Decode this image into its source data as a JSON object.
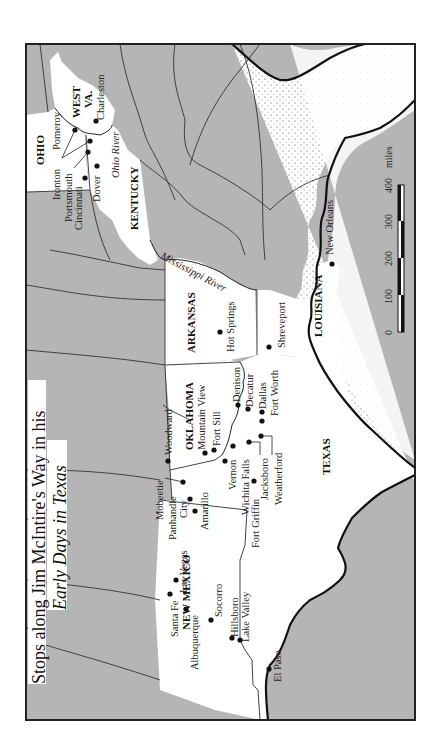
{
  "title": {
    "line1": "Stops along Jim McIntire's Way in his",
    "line2": "Early Days in Texas"
  },
  "states": {
    "ohio": "OHIO",
    "west_va_1": "WEST",
    "west_va_2": "VA.",
    "kentucky": "KENTUCKY",
    "arkansas": "ARKANSAS",
    "louisiana": "LOUISIANA",
    "oklahoma": "OKLAHOMA",
    "texas": "TEXAS",
    "new_mexico": "NEW MEXICO"
  },
  "rivers": {
    "ohio": "Ohio River",
    "mississippi": "Mississippi River"
  },
  "places": {
    "ironton": "Ironton",
    "pomeroy": "Pomeroy",
    "charleston": "Charleston",
    "portsmouth": "Portsmouth",
    "cincinnati": "Cincinnati",
    "dover": "Dover",
    "new_orleans": "New Orleans",
    "hot_springs": "Hot Springs",
    "shreveport": "Shreveport",
    "denison": "Denison",
    "decatur": "Decatur",
    "dallas": "Dallas",
    "fort_worth": "Fort Worth",
    "woodward": "Woodward",
    "mountain_view": "Mountain View",
    "fort_sill": "Fort Sill",
    "vernon": "Vernon",
    "wichita_falls": "Wichita Falls",
    "jacksboro": "Jacksboro",
    "weatherford": "Weatherford",
    "fort_griffin": "Fort Griffin",
    "mobeetie": "Mobeetie",
    "panhandle_city_1": "Panhandle",
    "panhandle_city_2": "City",
    "amarillo": "Amarillo",
    "santa_fe": "Santa Fe",
    "las_vegas": "Las Vegas",
    "albuquerque": "Albuquerque",
    "socorro": "Socorro",
    "hillsboro": "Hillsboro",
    "lake_valley": "Lake Valley",
    "el_paso": "El Paso"
  },
  "scale": {
    "ticks": [
      "0",
      "100",
      "200",
      "300",
      "400"
    ],
    "unit": "miles"
  },
  "colors": {
    "land_outside": "#b5b5b5",
    "land_route_states": "#ffffff",
    "border": "#333333"
  }
}
